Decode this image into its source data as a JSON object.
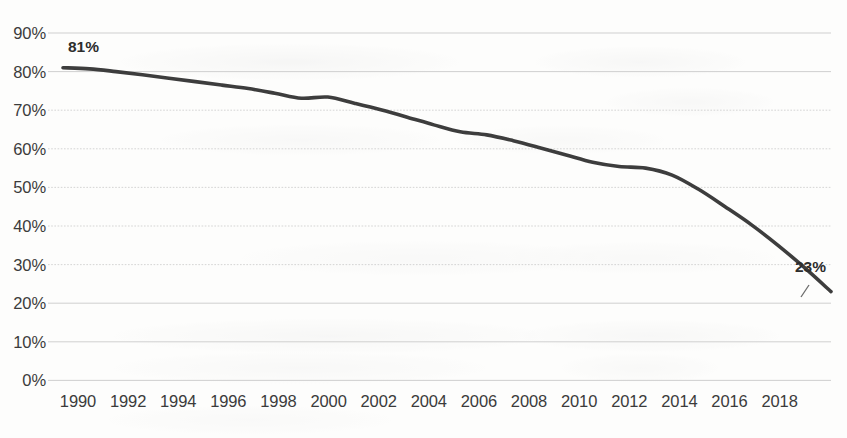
{
  "chart_data": {
    "type": "line",
    "title": "",
    "subtitle": "",
    "xlabel": "",
    "ylabel": "",
    "xlim": [
      1990,
      2019
    ],
    "ylim": [
      0,
      90
    ],
    "grid": true,
    "legend": false,
    "y_tick_labels": [
      "90%",
      "80%",
      "70%",
      "60%",
      "50%",
      "40%",
      "30%",
      "20%",
      "10%",
      "0%"
    ],
    "y_tick_values": [
      90,
      80,
      70,
      60,
      50,
      40,
      30,
      20,
      10,
      0
    ],
    "x_tick_labels": [
      "1990",
      "1992",
      "1994",
      "1996",
      "1998",
      "2000",
      "2002",
      "2004",
      "2006",
      "2008",
      "2010",
      "2012",
      "2014",
      "2016",
      "2018"
    ],
    "x_tick_values": [
      1990,
      1992,
      1994,
      1996,
      1998,
      2000,
      2002,
      2004,
      2006,
      2008,
      2010,
      2012,
      2014,
      2016,
      2018
    ],
    "x": [
      1990,
      1991,
      1992,
      1993,
      1994,
      1995,
      1996,
      1997,
      1998,
      1999,
      2000,
      2001,
      2002,
      2003,
      2004,
      2005,
      2006,
      2007,
      2008,
      2009,
      2010,
      2011,
      2012,
      2013,
      2014,
      2015,
      2016,
      2017,
      2018,
      2019
    ],
    "series": [
      {
        "name": "",
        "color": "#3d3d3d",
        "values": [
          81,
          80.7,
          80,
          79.2,
          78.3,
          77.4,
          76.5,
          75.6,
          74.4,
          73.1,
          73.4,
          71.8,
          70.1,
          68.2,
          66.2,
          64.4,
          63.6,
          62.1,
          60.3,
          58.4,
          56.5,
          55.4,
          55,
          53.2,
          49.5,
          45,
          40.3,
          35,
          29.2,
          23
        ]
      }
    ],
    "annotations": [
      {
        "name": "start-value-label",
        "text": "81%",
        "x": 1990,
        "y": 81
      },
      {
        "name": "end-value-label",
        "text": "23%",
        "x": 2019,
        "y": 23
      }
    ],
    "colors": {
      "line": "#3d3d3d",
      "gridline": "#c9c9c9",
      "axis_text": "#3b3b3b",
      "background": "#fdfdfc"
    }
  }
}
